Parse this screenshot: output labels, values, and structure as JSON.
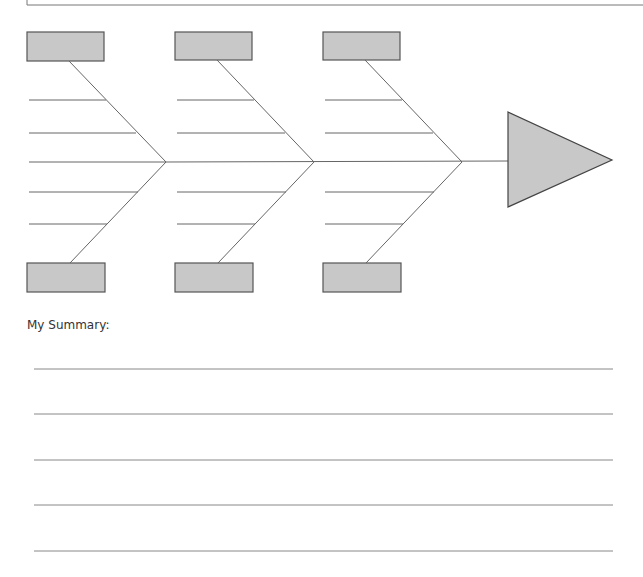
{
  "diagram": {
    "type": "fishbone",
    "colors": {
      "box_fill": "#c8c8c8",
      "box_stroke": "#555555",
      "line": "#666666",
      "head_fill": "#c8c8c8"
    },
    "sections": [
      {
        "top_box": "",
        "bottom_box": "",
        "ribs": [
          "",
          "",
          "",
          "",
          ""
        ]
      },
      {
        "top_box": "",
        "bottom_box": "",
        "ribs": [
          "",
          "",
          "",
          ""
        ]
      },
      {
        "top_box": "",
        "bottom_box": "",
        "ribs": [
          "",
          "",
          "",
          ""
        ]
      }
    ],
    "head": ""
  },
  "summary": {
    "label": "My Summary:",
    "lines": [
      "",
      "",
      "",
      "",
      ""
    ]
  }
}
